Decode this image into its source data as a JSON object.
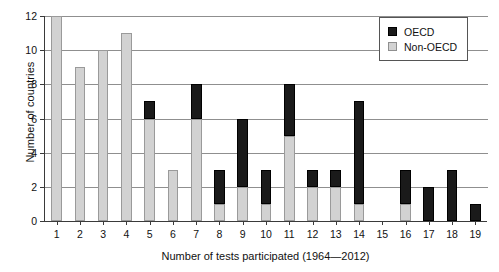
{
  "chart_data": {
    "type": "bar",
    "title": "",
    "subtitle": "",
    "stacked": true,
    "xlabel": "Number of tests participated (1964—2012)",
    "ylabel": "Number of countries",
    "categories": [
      "1",
      "2",
      "3",
      "4",
      "5",
      "6",
      "7",
      "8",
      "9",
      "10",
      "11",
      "12",
      "13",
      "14",
      "15",
      "16",
      "17",
      "18",
      "19"
    ],
    "ylim": [
      0,
      12
    ],
    "yticks": [
      0,
      2,
      4,
      6,
      8,
      10,
      12
    ],
    "ytick_labels": [
      "0",
      "2",
      "4",
      "6",
      "8",
      "10",
      "12"
    ],
    "grid": "horizontal",
    "legend_position": "top-right",
    "series": [
      {
        "name": "Non-OECD",
        "color": "#d2d2d2",
        "values": [
          12,
          9,
          10,
          11,
          6,
          3,
          6,
          1,
          2,
          1,
          5,
          2,
          2,
          1,
          0,
          1,
          0,
          0,
          0
        ]
      },
      {
        "name": "OECD",
        "color": "#1a1a1a",
        "values": [
          0,
          0,
          0,
          0,
          1,
          0,
          2,
          2,
          4,
          2,
          3,
          1,
          1,
          6,
          0,
          2,
          2,
          3,
          1
        ]
      }
    ],
    "totals": [
      12,
      9,
      10,
      11,
      7,
      3,
      8,
      3,
      6,
      3,
      8,
      3,
      3,
      7,
      0,
      3,
      2,
      3,
      1
    ]
  },
  "legend": {
    "entries": [
      {
        "label": "OECD",
        "color": "#1a1a1a"
      },
      {
        "label": "Non-OECD",
        "color": "#d2d2d2"
      }
    ]
  },
  "axes": {
    "y_title": "Number of countries",
    "x_title": "Number of tests participated (1964—2012)"
  }
}
